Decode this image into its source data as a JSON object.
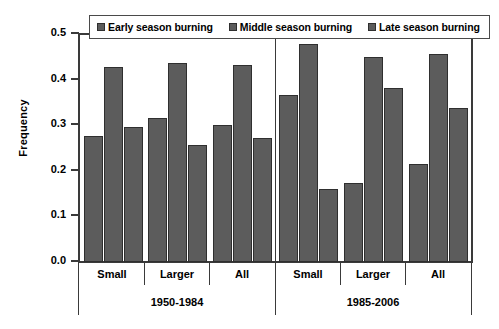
{
  "chart_data": {
    "type": "bar",
    "title": "",
    "xlabel": "",
    "ylabel": "Frequency",
    "ylim": [
      0.0,
      0.5
    ],
    "ytick_labels": [
      "0.5",
      "0.4",
      "0.3",
      "0.2",
      "0.1",
      "0.0"
    ],
    "ytick_values": [
      0.5,
      0.4,
      0.3,
      0.2,
      0.1,
      0.0
    ],
    "grid": false,
    "legend_position": "top-center",
    "categories": [
      "Small",
      "Larger",
      "All",
      "Small",
      "Larger",
      "All"
    ],
    "groups": [
      {
        "period": "1950-1984",
        "categories": [
          "Small",
          "Larger",
          "All"
        ],
        "values": {
          "Early season burning": [
            0.275,
            0.315,
            0.3
          ],
          "Middle season burning": [
            0.425,
            0.435,
            0.43
          ],
          "Late season burning": [
            0.295,
            0.255,
            0.27
          ]
        }
      },
      {
        "period": "1985-2006",
        "categories": [
          "Small",
          "Larger",
          "All"
        ],
        "values": {
          "Early season burning": [
            0.365,
            0.172,
            0.213
          ],
          "Middle season burning": [
            0.477,
            0.447,
            0.455
          ],
          "Late season burning": [
            0.16,
            0.381,
            0.337
          ]
        }
      }
    ],
    "series": [
      {
        "name": "Early season burning",
        "color": "#5c5c5c",
        "values": [
          0.275,
          0.315,
          0.3,
          0.365,
          0.172,
          0.213
        ]
      },
      {
        "name": "Middle season burning",
        "color": "#5c5c5c",
        "values": [
          0.425,
          0.435,
          0.43,
          0.477,
          0.447,
          0.455
        ]
      },
      {
        "name": "Late season burning",
        "color": "#5c5c5c",
        "values": [
          0.295,
          0.255,
          0.27,
          0.16,
          0.381,
          0.337
        ]
      }
    ],
    "period_labels": [
      "1950-1984",
      "1985-2006"
    ]
  },
  "legend": {
    "items": [
      {
        "label": "Early season burning"
      },
      {
        "label": "Middle season burning"
      },
      {
        "label": "Late season burning"
      }
    ]
  },
  "axes": {
    "y_label": "Frequency"
  }
}
